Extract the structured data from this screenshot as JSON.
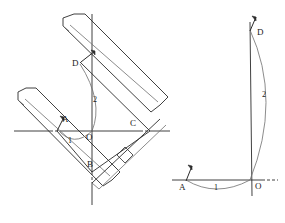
{
  "figure": {
    "ink_color": "#2b2b2b",
    "stroke_color_light": "#6e6e6e",
    "background": "#ffffff"
  },
  "left_diagram": {
    "name": "set-square-construction",
    "points": [
      {
        "id": "A",
        "label": "A",
        "x": 56,
        "y": 124
      },
      {
        "id": "O",
        "label": "O",
        "x": 92,
        "y": 131
      },
      {
        "id": "C",
        "label": "C",
        "x": 133,
        "y": 124
      },
      {
        "id": "B",
        "label": "B",
        "x": 92,
        "y": 166
      },
      {
        "id": "D",
        "label": "D",
        "x": 80,
        "y": 62
      }
    ],
    "arcs": [
      {
        "id": "arc1",
        "label": "1",
        "label_x": 70,
        "label_y": 139
      },
      {
        "id": "arc2",
        "label": "2",
        "label_x": 95,
        "label_y": 100
      }
    ],
    "axes": {
      "horizontal_label": "x-axis",
      "vertical_label": "y-axis"
    },
    "right_angle_marker": "right-angle-mark"
  },
  "right_diagram": {
    "name": "resulting-construction",
    "points": [
      {
        "id": "D",
        "label": "D",
        "x": 254,
        "y": 30
      },
      {
        "id": "O",
        "label": "O",
        "x": 253,
        "y": 180
      },
      {
        "id": "A",
        "label": "A",
        "x": 184,
        "y": 182
      }
    ],
    "arcs": [
      {
        "id": "arc1",
        "label": "1",
        "label_x": 215,
        "label_y": 186
      },
      {
        "id": "arc2",
        "label": "2",
        "label_x": 264,
        "label_y": 94
      }
    ]
  }
}
